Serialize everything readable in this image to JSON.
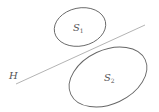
{
  "diagram": {
    "title": "",
    "colors": {
      "background": "#ffffff",
      "ellipse_stroke": "#666666",
      "line_stroke": "#aaaaaa",
      "text": "#555555"
    },
    "sets": [
      {
        "id": "S1",
        "name": "S",
        "subscript": "1",
        "cx": 80,
        "cy": 27,
        "rx": 26,
        "ry": 19,
        "rotate": -12
      },
      {
        "id": "S2",
        "name": "S",
        "subscript": "2",
        "cx": 108,
        "cy": 77,
        "rx": 41,
        "ry": 27,
        "rotate": -25
      }
    ],
    "hyperplane": {
      "name": "H",
      "x1": 16,
      "y1": 84,
      "x2": 145,
      "y2": 25
    }
  }
}
